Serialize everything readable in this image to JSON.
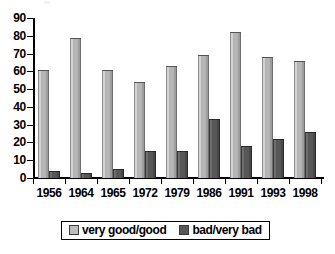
{
  "chart_data": {
    "type": "bar",
    "title": "",
    "subtitle": "",
    "xlabel": "",
    "ylabel": "",
    "categories": [
      "1956",
      "1964",
      "1965",
      "1972",
      "1979",
      "1986",
      "1991",
      "1993",
      "1998"
    ],
    "series": [
      {
        "name": "very good/good",
        "color": "#b5b5b5",
        "values": [
          61,
          79,
          61,
          54,
          63,
          69,
          82,
          68,
          66
        ]
      },
      {
        "name": "bad/very bad",
        "color": "#575757",
        "values": [
          4,
          3,
          5,
          15,
          15,
          33,
          18,
          22,
          26
        ]
      }
    ],
    "ylim": [
      0,
      90
    ],
    "ytick_step": 10,
    "yticks": [
      "90",
      "80",
      "70",
      "60",
      "50",
      "40",
      "30",
      "20",
      "10",
      "0"
    ],
    "grid": false,
    "legend_position": "bottom"
  },
  "legend": {
    "items": [
      {
        "label": "very good/good",
        "swatch": "light-gray-swatch-icon"
      },
      {
        "label": "bad/very bad",
        "swatch": "dark-gray-swatch-icon"
      }
    ]
  }
}
